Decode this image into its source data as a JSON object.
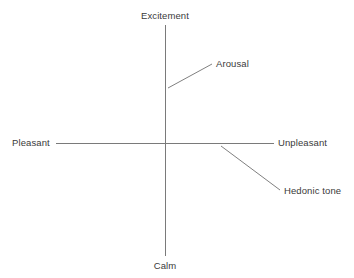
{
  "diagram": {
    "title_visible": false,
    "background_color": "#ffffff",
    "line_color": "#7a7a7a",
    "text_color": "#3a3a3a",
    "axes": {
      "vertical": {
        "name": "arousal-axis",
        "top_label": "Excitement",
        "bottom_label": "Calm",
        "x": 165,
        "y_top": 25,
        "y_bottom": 256
      },
      "horizontal": {
        "name": "hedonic-tone-axis",
        "left_label": "Pleasant",
        "right_label": "Unpleasant",
        "y": 143,
        "x_left": 56,
        "x_right": 274
      }
    },
    "annotations": [
      {
        "name": "arousal",
        "label": "Arousal",
        "leader_line": {
          "x1": 168,
          "y1": 88,
          "x2": 212,
          "y2": 64
        }
      },
      {
        "name": "hedonic-tone",
        "label": "Hedonic tone",
        "leader_line": {
          "x1": 221,
          "y1": 146,
          "x2": 280,
          "y2": 190
        }
      }
    ]
  }
}
